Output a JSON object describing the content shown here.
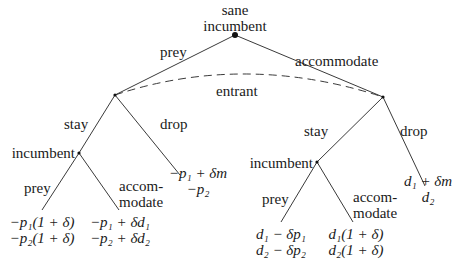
{
  "diagram": {
    "type": "extensive-form game tree",
    "colors": {
      "line": "#3a3a3a",
      "text": "#1a1a1a",
      "node": "#111111",
      "background": "#ffffff"
    },
    "nodes": {
      "root": {
        "label_line1": "sane",
        "label_line2": "incumbent"
      },
      "info_set": {
        "label": "entrant"
      },
      "left_incumbent": {
        "label": "incumbent"
      },
      "right_incumbent": {
        "label": "incumbent"
      }
    },
    "edges": {
      "root_left": "prey",
      "root_right": "accommodate",
      "left_stay": "stay",
      "left_drop": "drop",
      "right_stay": "stay",
      "right_drop": "drop",
      "ll_prey": "prey",
      "ll_accom_line1": "accom-",
      "ll_accom_line2": "modate",
      "rl_prey": "prey",
      "rl_accom_line1": "accom-",
      "rl_accom_line2": "modate"
    },
    "payoffs": {
      "left_prey": {
        "line1": "−p₁(1 + δ)",
        "line2": "−p₂(1 + δ)"
      },
      "left_accommodate": {
        "line1": "−p₁ + δd₁",
        "line2": "−p₂ + δd₂"
      },
      "left_drop": {
        "line1": "−p₁ + δm",
        "line2": "−p₂"
      },
      "right_prey": {
        "line1": "d₁ − δp₁",
        "line2": "d₂ − δp₂"
      },
      "right_accommodate": {
        "line1": "d₁(1 + δ)",
        "line2": "d₂(1 + δ)"
      },
      "right_drop": {
        "line1": "d₁ + δm",
        "line2": "d₂"
      }
    }
  }
}
